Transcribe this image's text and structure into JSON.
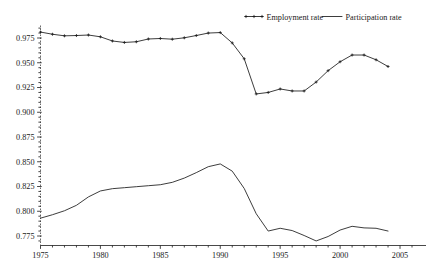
{
  "chart_data": {
    "type": "line",
    "title": "",
    "subtitle": "",
    "xlabel": "",
    "ylabel": "",
    "xlim": [
      1975,
      2006
    ],
    "ylim": [
      0.7625,
      0.9875
    ],
    "grid": false,
    "legend_position": "top-right",
    "x_ticks": [
      1975,
      1980,
      1985,
      1990,
      1995,
      2000,
      2005
    ],
    "x_tick_labels": [
      "1975",
      "1980",
      "1985",
      "1990",
      "1995",
      "2000",
      "2005"
    ],
    "x_minor_step": 1,
    "y_ticks": [
      0.775,
      0.8,
      0.825,
      0.85,
      0.875,
      0.9,
      0.925,
      0.95,
      0.975
    ],
    "y_tick_labels": [
      "0.775",
      "0.800",
      "0.825",
      "0.850",
      "0.875",
      "0.900",
      "0.925",
      "0.950",
      "0.975"
    ],
    "y_minor_step": 0.005,
    "x": [
      1975,
      1976,
      1977,
      1978,
      1979,
      1980,
      1981,
      1982,
      1983,
      1984,
      1985,
      1986,
      1987,
      1988,
      1989,
      1990,
      1991,
      1992,
      1993,
      1994,
      1995,
      1996,
      1997,
      1998,
      1999,
      2000,
      2001,
      2002,
      2003,
      2004
    ],
    "series": [
      {
        "name": "Employment rate",
        "marker": "plus",
        "values": [
          0.981,
          0.9788,
          0.9772,
          0.9775,
          0.978,
          0.9762,
          0.972,
          0.9705,
          0.9712,
          0.974,
          0.9745,
          0.9738,
          0.9752,
          0.9775,
          0.98,
          0.9805,
          0.97,
          0.954,
          0.9185,
          0.92,
          0.9235,
          0.9215,
          0.9215,
          0.9305,
          0.942,
          0.951,
          0.9578,
          0.9578,
          0.953,
          0.9462
        ]
      },
      {
        "name": "Participation rate",
        "marker": "none",
        "values": [
          0.793,
          0.7965,
          0.8005,
          0.806,
          0.8145,
          0.8205,
          0.8228,
          0.8238,
          0.8248,
          0.8258,
          0.8268,
          0.8292,
          0.8335,
          0.839,
          0.845,
          0.8478,
          0.8405,
          0.823,
          0.7975,
          0.78,
          0.7828,
          0.7805,
          0.7755,
          0.77,
          0.7745,
          0.781,
          0.7848,
          0.7832,
          0.7828,
          0.78
        ]
      }
    ]
  },
  "legend": {
    "entries": [
      {
        "label": "Employment rate",
        "marker": "plus-line"
      },
      {
        "label": "Participation rate",
        "marker": "plain-line"
      }
    ]
  },
  "colors": {
    "line": "#1a1a1a",
    "axis": "#1a1a1a",
    "background": "#ffffff"
  }
}
